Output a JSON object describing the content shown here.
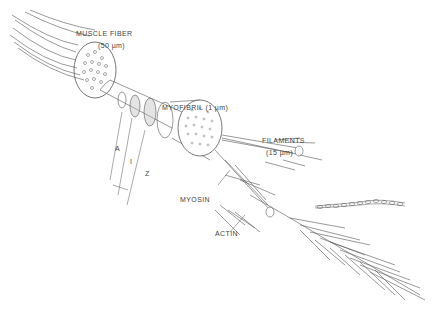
{
  "diagram": {
    "labels": {
      "muscle_fiber": "MUSCLE  FIBER",
      "muscle_fiber_size": "(50 µm)",
      "myofibril": "MYOFIBRIL  (1 µm)",
      "filaments": "FILAMENTS",
      "filaments_size": "(15 µm)",
      "band_a": "A",
      "band_i": "I",
      "band_z": "Z",
      "myosin": "MYOSIN",
      "actin": "ACTIN"
    },
    "colors": {
      "line": "#555555",
      "text": "#444444",
      "background": "#ffffff"
    }
  }
}
